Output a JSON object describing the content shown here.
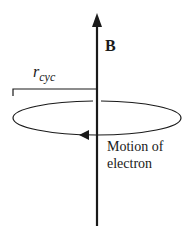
{
  "diagram": {
    "field_label": "B",
    "radius_label": {
      "main": "r",
      "subscript": "cyc"
    },
    "motion_label": {
      "line1": "Motion of",
      "line2": "electron"
    },
    "colors": {
      "stroke": "#1a1a1a",
      "background": "#ffffff"
    }
  }
}
